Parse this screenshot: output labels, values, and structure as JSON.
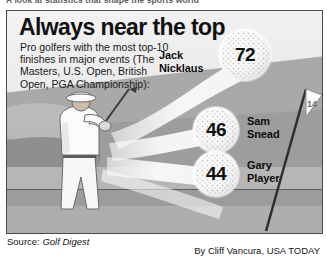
{
  "masthead": {
    "text": "A look at statistics that shape the sports world"
  },
  "headline": "Always near the top",
  "deck": "Pro golfers with the most top-10 finishes in major events (The Masters, U.S. Open, British Open, PGA Championship):",
  "players": [
    {
      "rank": 1,
      "value": "72",
      "first_name": "Jack",
      "last_name": "Nicklaus",
      "icon": "golf-ball-icon"
    },
    {
      "rank": 2,
      "value": "46",
      "first_name": "Sam",
      "last_name": "Snead",
      "icon": "golf-ball-icon"
    },
    {
      "rank": 3,
      "value": "44",
      "first_name": "Gary",
      "last_name": "Player",
      "icon": "golf-ball-icon"
    }
  ],
  "footer": {
    "source_prefix": "Source: ",
    "source_name": "Golf Digest",
    "credit": "By Cliff Vancura, USA TODAY"
  },
  "illustration": {
    "golfer": "golfer-swing-icon",
    "flag": "golf-flagstick-icon",
    "arcs": "ball-trajectory-arcs"
  },
  "colors": {
    "headline": "#111111",
    "frame_border": "#4a4a4a",
    "sky": "#efefef",
    "midground": "#a9a9a9",
    "foreground": "#aeaeae",
    "ball_fill": "#ffffff",
    "arc": "#f2f2f2"
  }
}
